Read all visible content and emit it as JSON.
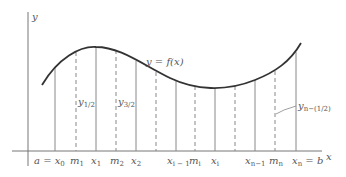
{
  "figure": {
    "type": "midpoint-rule-diagram",
    "axes": {
      "y_label": "y",
      "x_label": "x"
    },
    "curve": {
      "label": "y = f(x)"
    },
    "ordinates": {
      "first": {
        "base": "y",
        "sub": "1/2"
      },
      "second": {
        "base": "y",
        "sub": "3/2"
      },
      "last": {
        "base": "y",
        "sub": "n−(1/2)"
      }
    },
    "x_ticks": [
      {
        "id": "x0",
        "label": "a = x",
        "sub": "0",
        "kind": "partition"
      },
      {
        "id": "m1",
        "label": "m",
        "sub": "1",
        "kind": "midpoint"
      },
      {
        "id": "x1",
        "label": "x",
        "sub": "1",
        "kind": "partition"
      },
      {
        "id": "m2",
        "label": "m",
        "sub": "2",
        "kind": "midpoint"
      },
      {
        "id": "x2",
        "label": "x",
        "sub": "2",
        "kind": "partition"
      },
      {
        "id": "xi-1",
        "label": "x",
        "sub": "i − 1",
        "kind": "partition"
      },
      {
        "id": "mi",
        "label": "m",
        "sub": "i",
        "kind": "midpoint"
      },
      {
        "id": "xi",
        "label": "x",
        "sub": "i",
        "kind": "partition"
      },
      {
        "id": "xn-1",
        "label": "x",
        "sub": "n−1",
        "kind": "partition"
      },
      {
        "id": "mn",
        "label": "m",
        "sub": "n",
        "kind": "midpoint"
      },
      {
        "id": "xn",
        "label": "x",
        "sub": "n",
        "suffix": " = b",
        "kind": "partition"
      }
    ],
    "colors": {
      "curve": "#333333",
      "axis": "#666666",
      "line": "#777777",
      "text": "#555555"
    }
  }
}
